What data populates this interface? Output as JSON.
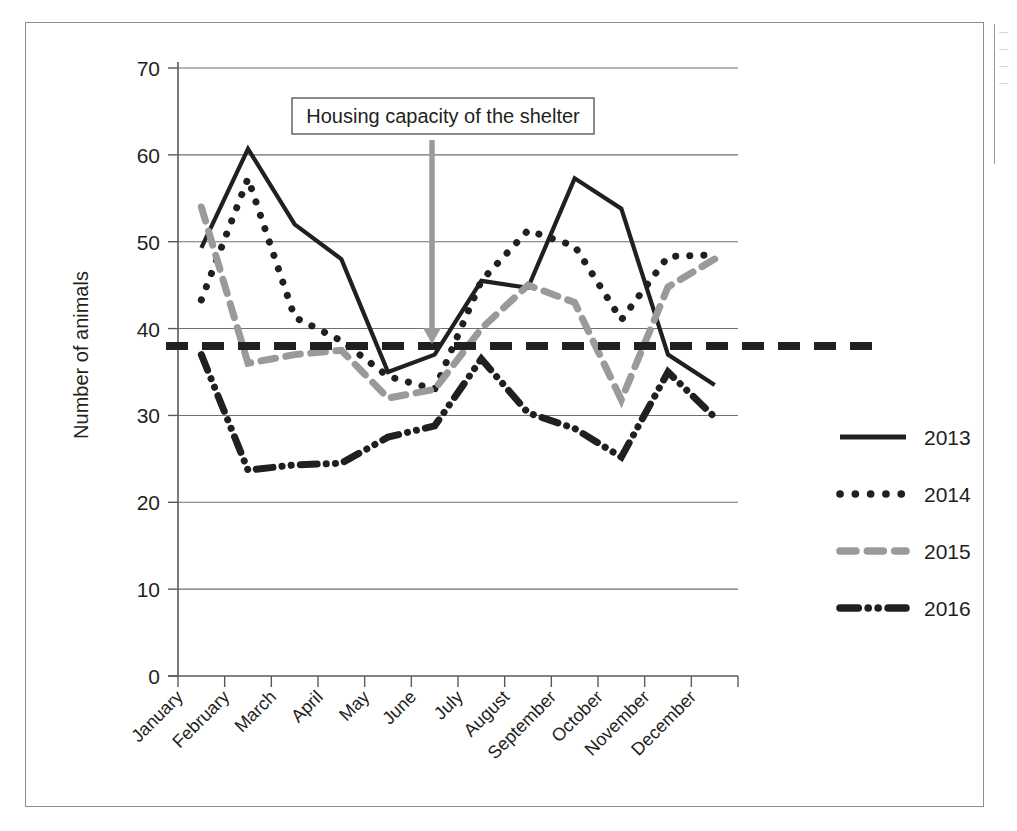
{
  "chart_data": {
    "type": "line",
    "title": "",
    "xlabel": "",
    "ylabel": "Number of animals",
    "categories": [
      "January",
      "February",
      "March",
      "April",
      "May",
      "June",
      "July",
      "August",
      "September",
      "October",
      "November",
      "December"
    ],
    "ylim": [
      0,
      70
    ],
    "yticks": [
      0,
      10,
      20,
      30,
      40,
      50,
      60,
      70
    ],
    "grid": true,
    "legend_position": "right",
    "series": [
      {
        "name": "2013",
        "style": "solid",
        "color": "#231f20",
        "values": [
          49.3,
          60.7,
          52.0,
          48.0,
          35.0,
          37.0,
          45.5,
          44.7,
          57.3,
          53.8,
          37.0,
          33.5
        ]
      },
      {
        "name": "2014",
        "style": "dotted",
        "color": "#231f20",
        "values": [
          43.3,
          57.3,
          41.3,
          38.6,
          34.5,
          33.0,
          45.5,
          51.3,
          49.5,
          41.0,
          48.3,
          48.5
        ]
      },
      {
        "name": "2015",
        "style": "dashed",
        "color": "#9a9a9a",
        "values": [
          54.0,
          36.0,
          37.0,
          37.5,
          32.0,
          33.0,
          40.0,
          45.0,
          43.0,
          31.8,
          44.8,
          48.0
        ]
      },
      {
        "name": "2016",
        "style": "dash-dot-dot",
        "color": "#231f20",
        "values": [
          37.0,
          23.7,
          24.3,
          24.5,
          27.5,
          28.8,
          36.5,
          30.3,
          28.5,
          25.2,
          35.0,
          29.8
        ]
      }
    ],
    "reference_line": {
      "label": "Housing capacity of the shelter",
      "value": 38,
      "style": "dashed",
      "color": "#231f20"
    },
    "annotation": {
      "text": "Housing capacity of the shelter",
      "arrow_color": "#9a9a9a",
      "arrow_target_value": 38
    }
  },
  "legend": {
    "items": [
      {
        "label": "2013"
      },
      {
        "label": "2014"
      },
      {
        "label": "2015"
      },
      {
        "label": "2016"
      }
    ]
  },
  "edge_fragments": [
    "—",
    "—",
    "—",
    "—"
  ]
}
